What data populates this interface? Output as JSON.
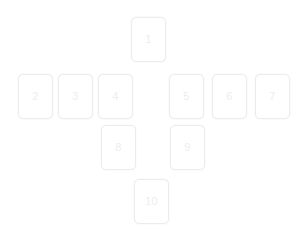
{
  "page": {
    "background_color": "#ffffff",
    "width": 301,
    "height": 239,
    "layout_name": "cross-card-grid"
  },
  "style": {
    "card_background": "#ffffff",
    "card_border_color": "#ececec",
    "card_border_radius": 5,
    "label_color": "#ededed",
    "label_font_size": 11
  },
  "cards": [
    {
      "id": "card-1",
      "label": "1",
      "x": 131,
      "y": 17,
      "w": 35,
      "h": 45,
      "row": 1,
      "col": 4
    },
    {
      "id": "card-2",
      "label": "2",
      "x": 18,
      "y": 74,
      "w": 35,
      "h": 45,
      "row": 2,
      "col": 1
    },
    {
      "id": "card-3",
      "label": "3",
      "x": 58,
      "y": 74,
      "w": 35,
      "h": 45,
      "row": 2,
      "col": 2
    },
    {
      "id": "card-4",
      "label": "4",
      "x": 98,
      "y": 74,
      "w": 35,
      "h": 45,
      "row": 2,
      "col": 3
    },
    {
      "id": "card-5",
      "label": "5",
      "x": 169,
      "y": 74,
      "w": 35,
      "h": 45,
      "row": 2,
      "col": 5
    },
    {
      "id": "card-6",
      "label": "6",
      "x": 212,
      "y": 74,
      "w": 35,
      "h": 45,
      "row": 2,
      "col": 6
    },
    {
      "id": "card-7",
      "label": "7",
      "x": 255,
      "y": 74,
      "w": 35,
      "h": 45,
      "row": 2,
      "col": 7
    },
    {
      "id": "card-8",
      "label": "8",
      "x": 101,
      "y": 125,
      "w": 35,
      "h": 45,
      "row": 3,
      "col": 3
    },
    {
      "id": "card-9",
      "label": "9",
      "x": 170,
      "y": 125,
      "w": 35,
      "h": 45,
      "row": 3,
      "col": 5
    },
    {
      "id": "card-10",
      "label": "10",
      "x": 134,
      "y": 179,
      "w": 35,
      "h": 45,
      "row": 4,
      "col": 4
    }
  ]
}
